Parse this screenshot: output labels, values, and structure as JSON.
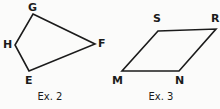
{
  "page": {
    "background_color": "#fbfbfa",
    "ink_color": "#1b1b1b",
    "width": 220,
    "height": 109
  },
  "figures": [
    {
      "id": "ex-2",
      "caption": "Ex. 2",
      "shape": "quadrilateral",
      "stroke_color": "#1b1b1b",
      "stroke_width": 1.6,
      "vertices": [
        {
          "name": "G",
          "label": "G",
          "x": 33,
          "y": 14
        },
        {
          "name": "F",
          "label": "F",
          "x": 95,
          "y": 44
        },
        {
          "name": "E",
          "label": "E",
          "x": 29,
          "y": 71
        },
        {
          "name": "H",
          "label": "H",
          "x": 15,
          "y": 45
        }
      ],
      "path": "M 33 14 L 95 44 L 29 71 L 15 45 Z"
    },
    {
      "id": "ex-3",
      "caption": "Ex. 3",
      "shape": "parallelogram",
      "stroke_color": "#1b1b1b",
      "stroke_width": 1.6,
      "vertices": [
        {
          "name": "S",
          "label": "S",
          "x": 158,
          "y": 31
        },
        {
          "name": "R",
          "label": "R",
          "x": 216,
          "y": 29
        },
        {
          "name": "N",
          "label": "N",
          "x": 179,
          "y": 71
        },
        {
          "name": "M",
          "label": "M",
          "x": 122,
          "y": 71
        }
      ],
      "path": "M 158 31 L 216 29 L 179 71 L 122 71 Z"
    }
  ]
}
